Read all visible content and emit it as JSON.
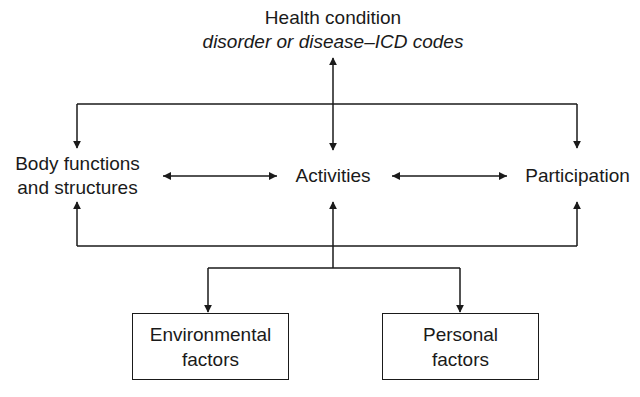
{
  "diagram": {
    "health_condition": {
      "title": "Health condition",
      "subtitle": "disorder or disease–ICD codes"
    },
    "body_functions": {
      "line1": "Body functions",
      "line2": "and structures"
    },
    "activities": "Activities",
    "participation": "Participation",
    "environmental_factors": {
      "line1": "Environmental",
      "line2": "factors"
    },
    "personal_factors": {
      "line1": "Personal",
      "line2": "factors"
    },
    "edges": [
      {
        "from": "Health condition",
        "to": "Activities",
        "type": "bidirectional"
      },
      {
        "from": "Health condition",
        "to": "Body functions and structures",
        "type": "directed"
      },
      {
        "from": "Health condition",
        "to": "Participation",
        "type": "directed"
      },
      {
        "from": "Body functions and structures",
        "to": "Activities",
        "type": "bidirectional"
      },
      {
        "from": "Activities",
        "to": "Participation",
        "type": "bidirectional"
      },
      {
        "from": "Contextual factors",
        "to": "Body functions and structures",
        "type": "directed"
      },
      {
        "from": "Contextual factors",
        "to": "Activities",
        "type": "directed"
      },
      {
        "from": "Contextual factors",
        "to": "Participation",
        "type": "directed"
      },
      {
        "from": "Activities",
        "to": "Environmental factors",
        "type": "directed"
      },
      {
        "from": "Activities",
        "to": "Personal factors",
        "type": "directed"
      }
    ]
  }
}
